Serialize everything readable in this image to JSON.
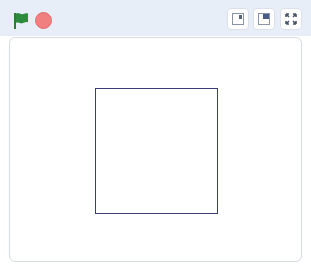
{
  "header": {
    "green_flag": {
      "icon": "green-flag-icon",
      "color": "#2e8b3e"
    },
    "stop": {
      "icon": "stop-icon",
      "color": "#f07f7f"
    },
    "stage_modes": [
      {
        "name": "small-stage-button",
        "icon": "small-stage-icon"
      },
      {
        "name": "normal-stage-button",
        "icon": "normal-stage-icon"
      },
      {
        "name": "fullscreen-button",
        "icon": "fullscreen-icon"
      }
    ]
  },
  "stage": {
    "drawing": {
      "shape": "square",
      "color": "#3c3a7a",
      "left": 85,
      "top": 50,
      "width": 123,
      "height": 126
    }
  }
}
